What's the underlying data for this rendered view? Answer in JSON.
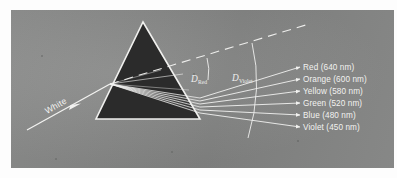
{
  "figure": {
    "kind": "prism-dispersion-diagram",
    "background_color": "#8b8c8b",
    "page_color": "#fdfdfd",
    "ray_color": "#f2f2f0",
    "prism_fill": "#2b2b2b",
    "prism_edge_color": "#f0f0ee"
  },
  "incident": {
    "label": "White"
  },
  "angles": [
    {
      "symbol": "D",
      "subscript": "Red"
    },
    {
      "symbol": "D",
      "subscript": "Violet"
    }
  ],
  "spectrum": [
    {
      "name": "Red",
      "wavelength": "640",
      "unit": "nm",
      "label": "Red (640 nm)"
    },
    {
      "name": "Orange",
      "wavelength": "600",
      "unit": "nm",
      "label": "Orange (600 nm)"
    },
    {
      "name": "Yellow",
      "wavelength": "580",
      "unit": "nm",
      "label": "Yellow (580 nm)"
    },
    {
      "name": "Green",
      "wavelength": "520",
      "unit": "nm",
      "label": "Green (520 nm)"
    },
    {
      "name": "Blue",
      "wavelength": "480",
      "unit": "nm",
      "label": "Blue (480 nm)"
    },
    {
      "name": "Violet",
      "wavelength": "450",
      "unit": "nm",
      "label": "Violet (450 nm)"
    }
  ]
}
